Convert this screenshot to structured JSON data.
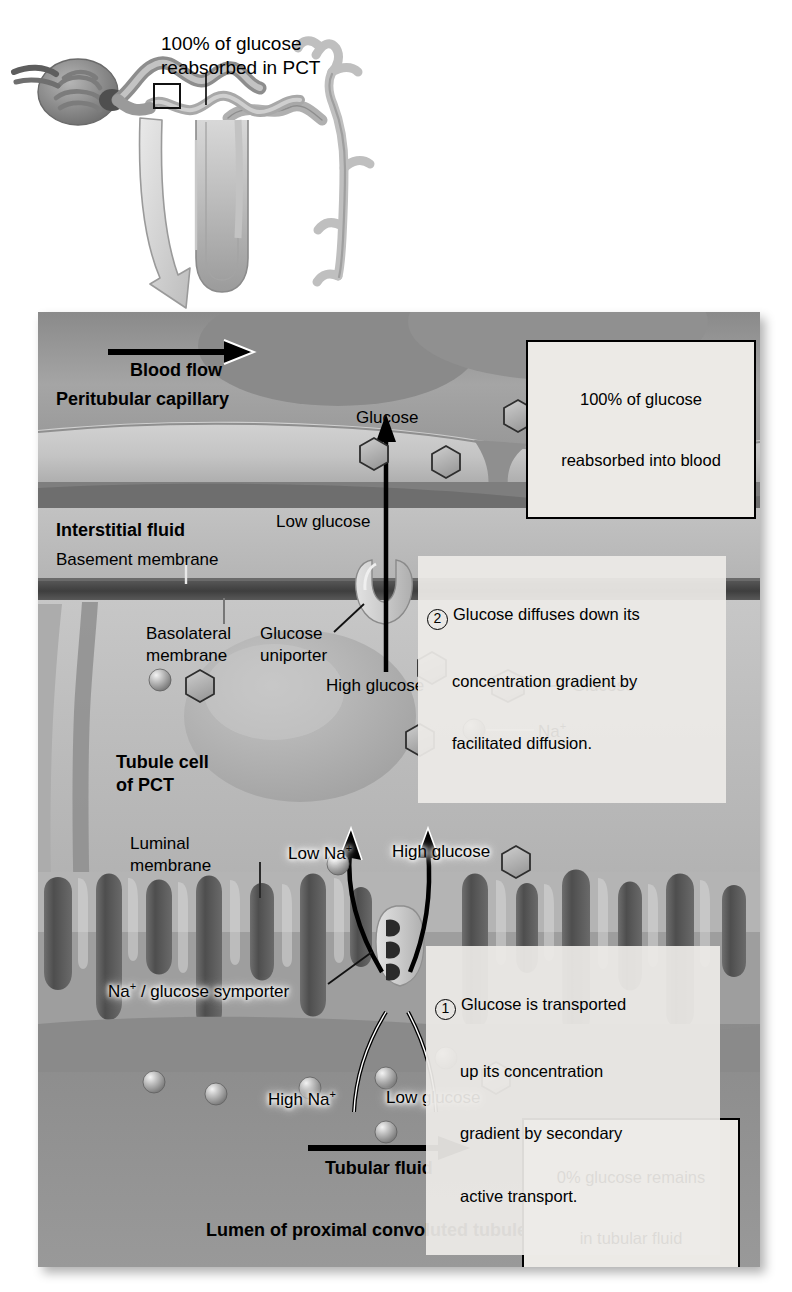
{
  "figure": {
    "domain": "biology-diagram"
  },
  "top_panel": {
    "name": "nephron-overview",
    "callout": "100% of glucose\nreabsorbed in PCT",
    "callout_line1": "100% of glucose",
    "callout_line2": "reabsorbed in PCT"
  },
  "main_panel": {
    "region_labels": {
      "peritubular_capillary": "Peritubular capillary",
      "interstitial_fluid": "Interstitial fluid",
      "basement_membrane": "Basement membrane",
      "basolateral_membrane": "Basolateral\nmembrane",
      "basolateral_membrane_l1": "Basolateral",
      "basolateral_membrane_l2": "membrane",
      "glucose_uniporter": "Glucose\nuniporter",
      "glucose_uniporter_l1": "Glucose",
      "glucose_uniporter_l2": "uniporter",
      "tubule_cell": "Tubule cell\nof PCT",
      "tubule_cell_l1": "Tubule cell",
      "tubule_cell_l2": "of PCT",
      "luminal_membrane": "Luminal\nmembrane",
      "luminal_membrane_l1": "Luminal",
      "luminal_membrane_l2": "membrane",
      "symporter": "Na+ / glucose symporter",
      "symporter_prefix": "Na",
      "symporter_suffix": " / glucose symporter",
      "lumen": "Lumen of proximal convoluted tubule (PCT)"
    },
    "flow_labels": {
      "blood_flow": "Blood flow",
      "tubular_fluid": "Tubular fluid"
    },
    "concentration_labels": {
      "low_glucose_interstitial": "Low glucose",
      "high_glucose_cell": "High glucose",
      "low_na_cell": "Low Na",
      "low_na_cell_sup": "+",
      "high_glucose_cell_top": "High glucose",
      "high_na_lumen": "High Na",
      "high_na_lumen_sup": "+",
      "low_glucose_lumen": "Low glucose"
    },
    "molecule_labels": {
      "glucose_capillary": "Glucose",
      "glucose_cell": "Glucose",
      "sodium_cell": "Na",
      "sodium_cell_sup": "+"
    },
    "callouts": [
      {
        "name": "reabsorbed-into-blood",
        "line1": "100% of glucose",
        "line2": "reabsorbed into blood"
      },
      {
        "name": "zero-percent-remains",
        "line1": "0% glucose remains",
        "line2": "in tubular fluid"
      }
    ],
    "steps": [
      {
        "number": "1",
        "text": "Glucose is transported\nup its concentration\ngradient by secondary\nactive transport.",
        "line1": "Glucose is transported",
        "line2": "up its concentration",
        "line3": "gradient by secondary",
        "line4": "active transport."
      },
      {
        "number": "2",
        "text": "Glucose diffuses down its\nconcentration gradient by\nfacilitated diffusion.",
        "line1": "Glucose diffuses down its",
        "line2": "concentration gradient by",
        "line3": "facilitated diffusion."
      }
    ]
  },
  "colors": {
    "panel_background": "#9e9e9e",
    "capillary_fill": "#8d8d8d",
    "membrane_dark": "#4a4a4a",
    "cell_fill": "#b9b9b9",
    "lumen_fill": "#8f8f8f",
    "callout_background": "#eceae6",
    "outline": "#000000",
    "microvilli_dark": "#5a5a5a"
  }
}
